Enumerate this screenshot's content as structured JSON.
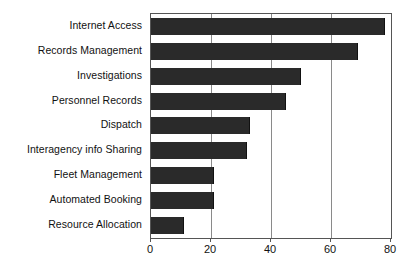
{
  "chart_data": {
    "type": "bar",
    "orientation": "horizontal",
    "title": "",
    "subtitle": "",
    "xlabel": "",
    "ylabel": "",
    "categories": [
      "Internet Access",
      "Records Management",
      "Investigations",
      "Personnel Records",
      "Dispatch",
      "Interagency info Sharing",
      "Fleet Management",
      "Automated Booking",
      "Resource Allocation"
    ],
    "values": [
      78,
      69,
      50,
      45,
      33,
      32,
      21,
      21,
      11
    ],
    "xlim": [
      0,
      80
    ],
    "xticks": [
      0,
      20,
      40,
      60,
      80
    ],
    "xtick_labels": [
      "0",
      "20",
      "40",
      "60",
      "80"
    ],
    "grid": "vertical-only",
    "legend": "none",
    "bar_color": "#2a2a2a",
    "plot_border_color": "#555555",
    "gridline_color": "#8a8a8a",
    "background_color": "#ffffff"
  }
}
